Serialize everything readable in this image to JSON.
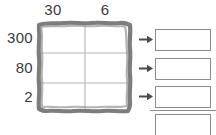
{
  "worksheet": {
    "type": "area-model-multiplication",
    "width": 216,
    "height": 135,
    "background_color": "#ffffff",
    "ink_color": "#3b3b3b",
    "grid_stroke_color": "#808080",
    "box_stroke_color": "#8c8c8c"
  },
  "area_model": {
    "columns": [
      {
        "label": "30"
      },
      {
        "label": "6"
      }
    ],
    "rows": [
      {
        "label": "300"
      },
      {
        "label": "80"
      },
      {
        "label": "2"
      }
    ],
    "cells": [
      [
        "",
        ""
      ],
      [
        "",
        ""
      ],
      [
        "",
        ""
      ]
    ]
  },
  "arrows": [
    {
      "name": "arrow-row-300",
      "glyph": "right-arrow"
    },
    {
      "name": "arrow-row-80",
      "glyph": "right-arrow"
    },
    {
      "name": "arrow-row-2",
      "glyph": "right-arrow"
    }
  ],
  "answer_boxes": [
    {
      "value": "",
      "placeholder": ""
    },
    {
      "value": "",
      "placeholder": ""
    },
    {
      "value": "",
      "placeholder": ""
    }
  ],
  "total_box": {
    "value": "",
    "placeholder": ""
  }
}
